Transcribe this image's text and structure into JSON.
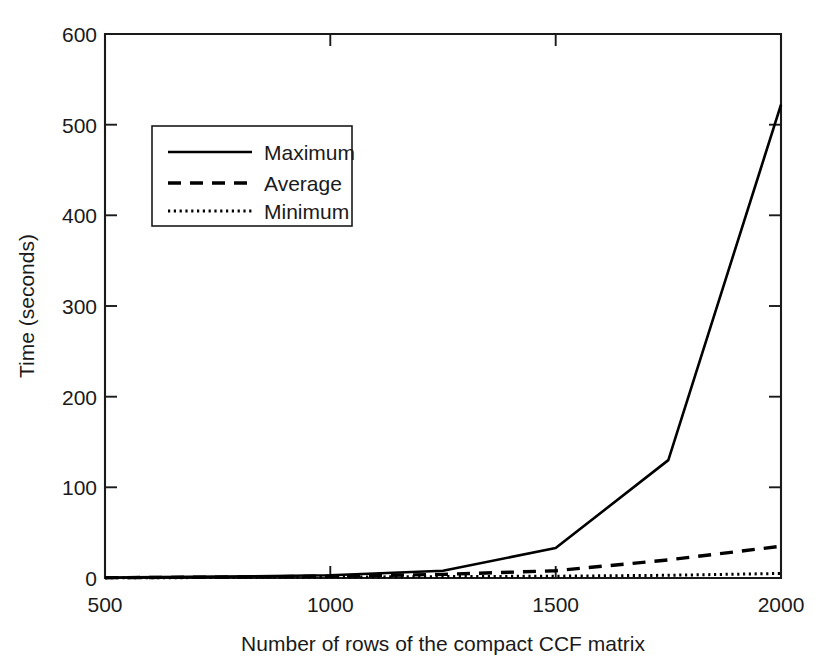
{
  "chart_data": {
    "type": "line",
    "title": "",
    "xlabel": "Number of rows of the compact CCF matrix",
    "ylabel": "Time (seconds)",
    "xlim": [
      500,
      2000
    ],
    "ylim": [
      0,
      600
    ],
    "xticks": [
      500,
      1000,
      1500,
      2000
    ],
    "xtick_labels": [
      "500",
      "1000",
      "1500",
      "2000"
    ],
    "yticks": [
      0,
      100,
      200,
      300,
      400,
      500,
      600
    ],
    "ytick_labels": [
      "0",
      "100",
      "200",
      "300",
      "400",
      "500",
      "600"
    ],
    "grid": false,
    "legend_position": "upper left",
    "x": [
      500,
      750,
      1000,
      1250,
      1500,
      1750,
      2000
    ],
    "series": [
      {
        "name": "Maximum",
        "style": "solid",
        "values": [
          0.5,
          1.5,
          3,
          8,
          33,
          130,
          522
        ]
      },
      {
        "name": "Average",
        "style": "dashed",
        "values": [
          0.3,
          1,
          2,
          4,
          8,
          20,
          35
        ]
      },
      {
        "name": "Minimum",
        "style": "dotted",
        "values": [
          0.2,
          0.5,
          1,
          1.5,
          2,
          3,
          5
        ]
      }
    ]
  },
  "axes": {
    "y_title": "Time (seconds)",
    "x_title": "Number of rows of the compact CCF matrix",
    "x_tick_0": "500",
    "x_tick_1": "1000",
    "x_tick_2": "1500",
    "x_tick_3": "2000",
    "y_tick_0": "0",
    "y_tick_1": "100",
    "y_tick_2": "200",
    "y_tick_3": "300",
    "y_tick_4": "400",
    "y_tick_5": "500",
    "y_tick_6": "600"
  },
  "legend": {
    "items": [
      {
        "label": "Maximum",
        "style": "solid"
      },
      {
        "label": "Average",
        "style": "dashed"
      },
      {
        "label": "Minimum",
        "style": "dotted"
      }
    ]
  },
  "colors": {
    "line": "#000000",
    "text": "#1a1a1a",
    "background": "#ffffff"
  }
}
